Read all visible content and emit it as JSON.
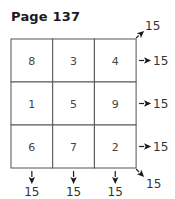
{
  "title": "Page 137",
  "magic_square": {
    "rows": [
      [
        8,
        3,
        4
      ],
      [
        1,
        5,
        9
      ],
      [
        6,
        7,
        2
      ]
    ],
    "row_sums": [
      "15",
      "15",
      "15"
    ],
    "column_sums": [
      "15",
      "15",
      "15"
    ],
    "diagonal_sums": {
      "anti_diagonal": "15",
      "main_diagonal": "15"
    }
  },
  "colors": {
    "grid_line": "#555555",
    "text": "#444444",
    "arrow": "#1a1a1a"
  }
}
